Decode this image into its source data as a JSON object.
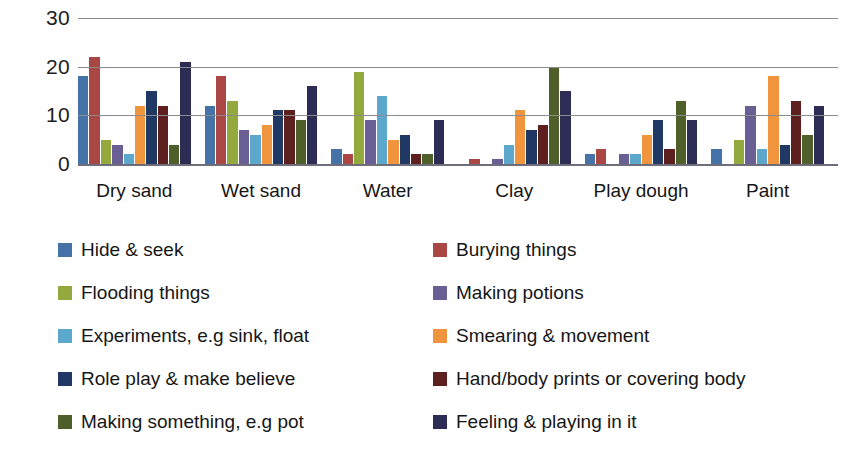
{
  "chart_data": {
    "type": "bar",
    "title": "",
    "subtitle": "",
    "xlabel": "",
    "ylabel": "",
    "ylim": [
      0,
      30
    ],
    "yticks": [
      30,
      20,
      10,
      0
    ],
    "grid": true,
    "legend_position": "bottom",
    "legend_columns": 2,
    "categories": [
      "Dry sand",
      "Wet sand",
      "Water",
      "Clay",
      "Play dough",
      "Paint"
    ],
    "series": [
      {
        "name": "Hide & seek",
        "color": "#4572a7",
        "values": [
          18,
          12,
          3,
          0,
          2,
          3
        ]
      },
      {
        "name": "Burying things",
        "color": "#aa4643",
        "values": [
          22,
          18,
          2,
          1,
          3,
          0
        ]
      },
      {
        "name": "Flooding things",
        "color": "#93a83d",
        "values": [
          5,
          13,
          19,
          0,
          0,
          5
        ]
      },
      {
        "name": "Making potions",
        "color": "#6a5f95",
        "values": [
          4,
          7,
          9,
          1,
          2,
          12
        ]
      },
      {
        "name": "Experiments, e.g sink, float",
        "color": "#5ba8cc",
        "values": [
          2,
          6,
          14,
          4,
          2,
          3
        ]
      },
      {
        "name": "Smearing & movement",
        "color": "#f0943e",
        "values": [
          12,
          8,
          5,
          11,
          6,
          18
        ]
      },
      {
        "name": "Role play & make believe",
        "color": "#1f3864",
        "values": [
          15,
          11,
          6,
          7,
          9,
          4
        ]
      },
      {
        "name": "Hand/body prints or covering body",
        "color": "#5e1f1f",
        "values": [
          12,
          11,
          2,
          8,
          3,
          13
        ]
      },
      {
        "name": "Making something, e.g pot",
        "color": "#4f5f29",
        "values": [
          4,
          9,
          2,
          20,
          13,
          6
        ]
      },
      {
        "name": "Feeling & playing in it",
        "color": "#2c2c54",
        "values": [
          21,
          16,
          9,
          15,
          9,
          12
        ]
      }
    ]
  }
}
